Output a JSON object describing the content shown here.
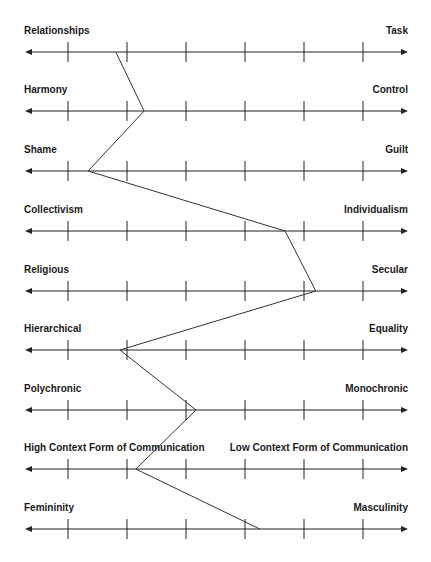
{
  "chart_data": {
    "type": "line",
    "title": "",
    "orientation": "profile",
    "scale": {
      "min_tick": 1,
      "max_tick": 6,
      "tick_count": 6,
      "tick_labels_visible": false
    },
    "dimensions": [
      {
        "left": "Relationships",
        "right": "Task",
        "value": 1.81
      },
      {
        "left": "Harmony",
        "right": "Control",
        "value": 2.29
      },
      {
        "left": "Shame",
        "right": "Guilt",
        "value": 1.34
      },
      {
        "left": "Collectivism",
        "right": "Individualism",
        "value": 4.68
      },
      {
        "left": "Religious",
        "right": "Secular",
        "value": 5.2
      },
      {
        "left": "Hierarchical",
        "right": "Equality",
        "value": 1.88
      },
      {
        "left": "Polychronic",
        "right": "Monochronic",
        "value": 3.17
      },
      {
        "left": "High Context Form of Communication",
        "right": "Low Context Form of Communication",
        "value": 2.15
      },
      {
        "left": "Femininity",
        "right": "Masculinity",
        "value": 4.25
      }
    ],
    "grid": false,
    "legend": "none",
    "line_color": "#333333"
  },
  "layout": {
    "axis_x_start": 25,
    "axis_x_end": 408,
    "tick_x_first": 68,
    "tick_spacing": 59,
    "axis_y": [
      52,
      111,
      171,
      231,
      291,
      350,
      410,
      469,
      529
    ],
    "label_offset_y": -27
  },
  "colors": {
    "axis": "#222222",
    "profile_line": "#333333",
    "text": "#1a1a1a"
  }
}
